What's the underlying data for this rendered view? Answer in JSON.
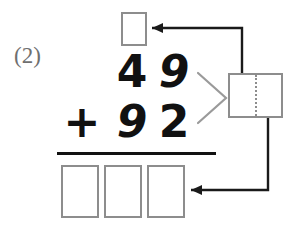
{
  "worksheet": {
    "problem_number": "(2)",
    "type": "vertical-addition-with-regrouping",
    "colors": {
      "box_border": "#8d8d8d",
      "digit": "#111111",
      "label": "#6f6f6f",
      "arrow": "#1a1a1a",
      "rule": "#111111",
      "chevron": "#9a9a9a",
      "background": "#ffffff"
    }
  },
  "problem": {
    "addend_top": {
      "tens": "4",
      "ones": "9"
    },
    "operator": "+",
    "addend_bottom": {
      "tens": "9",
      "ones": "2"
    },
    "carry_box": {
      "value": "",
      "label": "carry-box"
    },
    "sum_boxes": [
      {
        "value": "",
        "label": "sum-hundreds-box"
      },
      {
        "value": "",
        "label": "sum-tens-box"
      },
      {
        "value": "",
        "label": "sum-ones-box"
      }
    ],
    "split_box": {
      "left_value": "",
      "right_value": "",
      "label": "regroup-split-box"
    }
  },
  "annotations": {
    "chevron_icon": "chevron-right-icon",
    "arrow_to_carry": {
      "icon": "arrow-left-icon",
      "from": "split-box-top",
      "to": "carry-box"
    },
    "arrow_to_sum": {
      "icon": "arrow-left-icon",
      "from": "split-box-bottom",
      "to": "sum-ones-box"
    }
  }
}
